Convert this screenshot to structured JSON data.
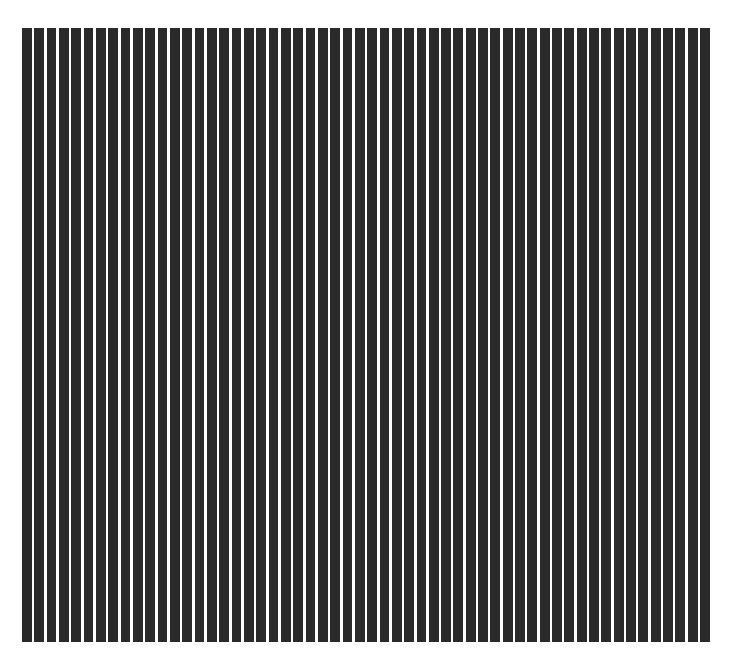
{
  "artwork": {
    "background_color": "#ffffff",
    "stripe_color": "#2a2a2a",
    "stripe_count": 56,
    "orientation": "vertical",
    "field": {
      "left": 22,
      "top": 28,
      "width": 688,
      "height": 614
    },
    "stripe_width": 9.8,
    "gap_width": 2.5
  }
}
